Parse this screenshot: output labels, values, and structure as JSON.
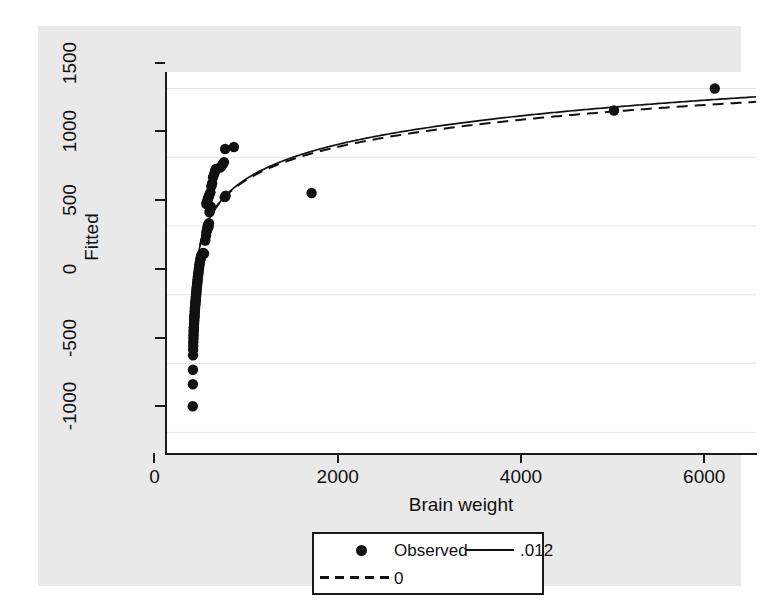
{
  "chart_data": {
    "type": "scatter",
    "title": "",
    "xlabel": "Brain weight",
    "ylabel": "Fitted",
    "xlim": [
      -300,
      6150
    ],
    "ylim": [
      -1150,
      1620
    ],
    "xticks": [
      0,
      2000,
      4000,
      6000
    ],
    "xtick_labels": [
      "0",
      "2000",
      "4000",
      "6000"
    ],
    "yticks": [
      -1000,
      -500,
      0,
      500,
      1000,
      1500
    ],
    "ytick_labels": [
      "-1000",
      "-500",
      "0",
      "500",
      "1000",
      "1500"
    ],
    "grid": "horizontal",
    "legend_position": "below-plot",
    "series": [
      {
        "name": "Observed",
        "type": "scatter",
        "marker": "filled-circle",
        "color": "#111111",
        "points": [
          [
            3,
            -810
          ],
          [
            4,
            -650
          ],
          [
            5,
            -545
          ],
          [
            6,
            -440
          ],
          [
            7,
            -400
          ],
          [
            8,
            -370
          ],
          [
            9,
            -345
          ],
          [
            10,
            -320
          ],
          [
            11,
            -300
          ],
          [
            12,
            -285
          ],
          [
            13,
            -265
          ],
          [
            14,
            -250
          ],
          [
            15,
            -235
          ],
          [
            17,
            -215
          ],
          [
            18,
            -200
          ],
          [
            19,
            -185
          ],
          [
            20,
            -170
          ],
          [
            21,
            -160
          ],
          [
            22,
            -150
          ],
          [
            24,
            -135
          ],
          [
            25,
            -120
          ],
          [
            26,
            -110
          ],
          [
            27,
            -100
          ],
          [
            28,
            -90
          ],
          [
            30,
            -75
          ],
          [
            31,
            -65
          ],
          [
            33,
            -55
          ],
          [
            34,
            -45
          ],
          [
            35,
            -35
          ],
          [
            37,
            -20
          ],
          [
            38,
            -10
          ],
          [
            40,
            0
          ],
          [
            41,
            10
          ],
          [
            43,
            22
          ],
          [
            44,
            35
          ],
          [
            46,
            48
          ],
          [
            48,
            60
          ],
          [
            50,
            72
          ],
          [
            52,
            85
          ],
          [
            54,
            98
          ],
          [
            56,
            110
          ],
          [
            58,
            122
          ],
          [
            60,
            135
          ],
          [
            62,
            148
          ],
          [
            65,
            160
          ],
          [
            68,
            175
          ],
          [
            70,
            190
          ],
          [
            73,
            205
          ],
          [
            76,
            220
          ],
          [
            80,
            235
          ],
          [
            84,
            250
          ],
          [
            88,
            262
          ],
          [
            92,
            272
          ],
          [
            96,
            282
          ],
          [
            100,
            290
          ],
          [
            105,
            295
          ],
          [
            110,
            300
          ],
          [
            118,
            305
          ],
          [
            126,
            300
          ],
          [
            140,
            395
          ],
          [
            148,
            430
          ],
          [
            152,
            455
          ],
          [
            158,
            470
          ],
          [
            160,
            480
          ],
          [
            166,
            500
          ],
          [
            172,
            510
          ],
          [
            176,
            495
          ],
          [
            180,
            520
          ],
          [
            186,
            600
          ],
          [
            190,
            615
          ],
          [
            196,
            625
          ],
          [
            200,
            640
          ],
          [
            150,
            660
          ],
          [
            158,
            672
          ],
          [
            164,
            690
          ],
          [
            170,
            700
          ],
          [
            178,
            715
          ],
          [
            186,
            730
          ],
          [
            196,
            745
          ],
          [
            206,
            790
          ],
          [
            214,
            810
          ],
          [
            224,
            855
          ],
          [
            238,
            880
          ],
          [
            246,
            900
          ],
          [
            256,
            915
          ],
          [
            300,
            925
          ],
          [
            316,
            935
          ],
          [
            330,
            950
          ],
          [
            344,
            965
          ],
          [
            352,
            710
          ],
          [
            362,
            720
          ],
          [
            356,
            1060
          ],
          [
            452,
            1075
          ],
          [
            1300,
            740
          ],
          [
            4600,
            1340
          ],
          [
            5700,
            1500
          ]
        ]
      },
      {
        "name": ".012",
        "type": "line",
        "style": "solid",
        "color": "#111111",
        "description": "Box-Cox fitted curve with lambda = .012"
      },
      {
        "name": "0",
        "type": "line",
        "style": "dashed",
        "color": "#111111",
        "description": "Box-Cox fitted curve with lambda = 0 (log)"
      }
    ]
  },
  "axes": {
    "y_title": "Fitted",
    "x_title": "Brain weight"
  },
  "legend": {
    "items": [
      {
        "label": "Observed",
        "key": "marker-dot"
      },
      {
        "label": ".012",
        "key": "solid-line"
      },
      {
        "label": "0",
        "key": "dashed-line"
      }
    ]
  },
  "colors": {
    "graph_background": "#e9e9e9",
    "plot_background": "#ffffff",
    "ink": "#111111",
    "grid": "#e4e4e4"
  }
}
